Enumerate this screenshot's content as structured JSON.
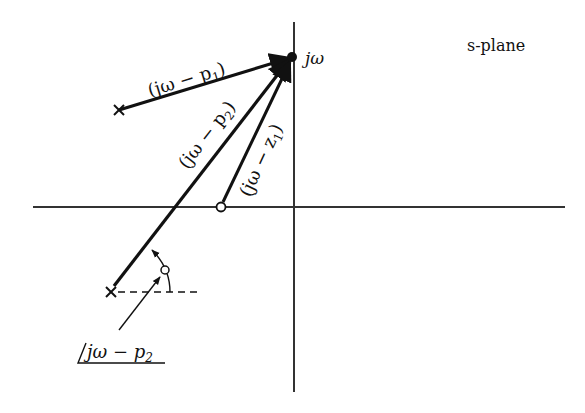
{
  "diagram": {
    "title": "s-plane",
    "colors": {
      "ink": "#111111",
      "axis": "#333333",
      "background": "#ffffff"
    },
    "points": {
      "jw": {
        "label": "jω",
        "x": 292,
        "y": 57
      },
      "p1": {
        "label": "p1",
        "x": 119,
        "y": 110,
        "marker": "x"
      },
      "p2": {
        "label": "p2",
        "x": 111,
        "y": 292,
        "marker": "x"
      },
      "z1": {
        "label": "z1",
        "x": 221,
        "y": 207,
        "marker": "o"
      },
      "origin": {
        "x": 294,
        "y": 207
      }
    },
    "vectors": [
      {
        "name": "vector-jw-minus-p1",
        "label": "(jω − p₁)",
        "from": "p1",
        "to": "jw"
      },
      {
        "name": "vector-jw-minus-p2",
        "label": "(jω − p₂)",
        "from": "p2",
        "to": "jw"
      },
      {
        "name": "vector-jw-minus-z1",
        "label": "(jω − z₁)",
        "from": "z1",
        "to": "jw"
      }
    ],
    "angle_annotation": {
      "label": "∠jω − p₂",
      "text_main": "jω − p",
      "subscript": "2"
    },
    "labels": {
      "jw": "jω",
      "plane": "s-plane",
      "v1": "(jω − p",
      "v1_sub": "1",
      "v2": "(jω − p",
      "v2_sub": "2",
      "v3": "(jω − z",
      "v3_sub": "1",
      "close": ")"
    }
  }
}
